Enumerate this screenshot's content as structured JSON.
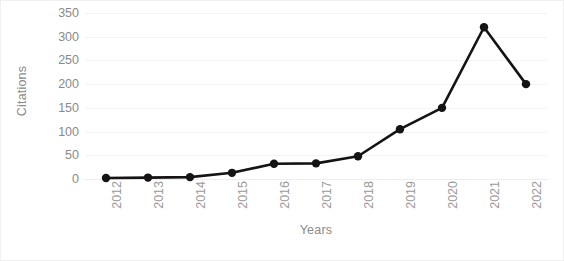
{
  "chart_data": {
    "type": "line",
    "title": "",
    "xlabel": "Years",
    "ylabel": "Citations",
    "categories": [
      "2012",
      "2013",
      "2014",
      "2015",
      "2016",
      "2017",
      "2018",
      "2019",
      "2020",
      "2021",
      "2022"
    ],
    "values": [
      2,
      3,
      4,
      13,
      32,
      33,
      48,
      105,
      150,
      320,
      200
    ],
    "series": [
      {
        "name": "Citations",
        "values": [
          2,
          3,
          4,
          13,
          32,
          33,
          48,
          105,
          150,
          320,
          200
        ]
      }
    ],
    "ylim": [
      0,
      350
    ],
    "yticks": [
      0,
      50,
      100,
      150,
      200,
      250,
      300,
      350
    ],
    "ytick_labels": [
      "0",
      "50",
      "100",
      "150",
      "200",
      "250",
      "300",
      "350"
    ],
    "grid": true,
    "grid_axis": "y",
    "legend": false,
    "legend_position": "none",
    "marker": "circle",
    "line_color": "#141414",
    "marker_color": "#141414",
    "grid_color": "#f4f4f4",
    "tick_label_color": "#9a9a9a",
    "axis_title_color": "#8a8a8a",
    "background_color": "#ffffff",
    "xtick_rotation": -90
  }
}
